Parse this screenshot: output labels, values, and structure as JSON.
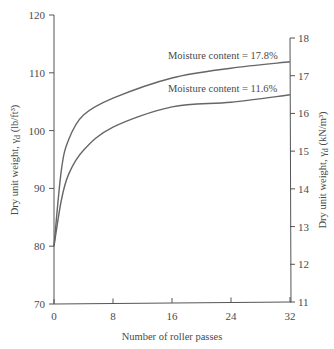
{
  "chart_data": {
    "type": "line",
    "title": "",
    "xlabel": "Number of roller passes",
    "ylabel_left": "Dry unit weight, γd (lb/ft³)",
    "ylabel_right": "Dry unit weight, γd (kN/m³)",
    "xlim": [
      0,
      32
    ],
    "ylim_left": [
      70,
      120
    ],
    "ylim_right": [
      11,
      18
    ],
    "x_ticks": [
      0,
      8,
      16,
      24,
      32
    ],
    "y_ticks_left": [
      70,
      80,
      90,
      100,
      110,
      120
    ],
    "y_ticks_right": [
      11,
      12,
      13,
      14,
      15,
      16,
      17,
      18
    ],
    "grid": false,
    "legend": "inline annotations above curves",
    "x": [
      0,
      1,
      2,
      4,
      8,
      16,
      24,
      32
    ],
    "series": [
      {
        "name": "Moisture content = 17.8%",
        "values": [
          80,
          93.2,
          98.5,
          102.7,
          105.6,
          109.1,
          110.8,
          111.9
        ]
      },
      {
        "name": "Moisture content = 11.6%",
        "values": [
          80,
          88,
          92.5,
          96.6,
          100.6,
          104.1,
          104.9,
          106.2
        ]
      }
    ],
    "annotations": [
      "Moisture content = 17.8%",
      "Moisture content = 11.6%"
    ]
  },
  "labels": {
    "xlabel": "Number of roller passes",
    "ylabel_left_main": "Dry unit weight, γ",
    "ylabel_left_sub": "d",
    "ylabel_left_unit": " (lb/ft³)",
    "ylabel_right_main": "Dry unit weight, γ",
    "ylabel_right_sub": "d",
    "ylabel_right_unit": " (kN/m³)",
    "annot_upper": "Moisture content = 17.8%",
    "annot_lower": "Moisture content = 11.6%"
  }
}
